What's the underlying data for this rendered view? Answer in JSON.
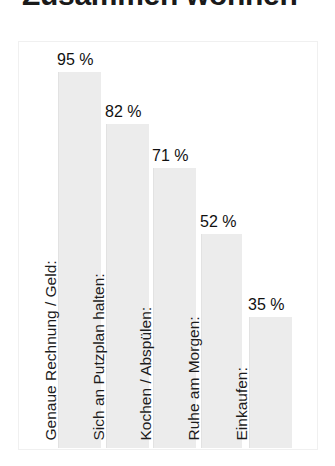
{
  "chart_data": {
    "type": "bar",
    "title": "Zusammen wohnen",
    "title_clipped": true,
    "xlabel": "",
    "ylabel": "",
    "ylim": [
      0,
      110
    ],
    "grid": false,
    "legend": "none",
    "value_suffix": "%",
    "categories": [
      "Genaue Rechnung / Geld:",
      "Sich an Putzplan halten:",
      "Kochen / Abspülen:",
      "Ruhe am Morgen:",
      "Einkaufen:"
    ],
    "values": [
      95,
      82,
      71,
      52,
      35
    ],
    "value_labels": [
      "95 %",
      "82 %",
      "71 %",
      "52 %",
      "35 %"
    ],
    "bar_color": "#ececec",
    "label_color": "#1c1c1c",
    "frame_color": "#f0f0f0",
    "background": "#ffffff"
  },
  "bars": [
    {
      "category": "Genaue Rechnung / Geld:",
      "value": 95,
      "value_label": "95 %",
      "left_px": 39,
      "width_px": 43,
      "height_px": 376,
      "label_bottom_px": 376
    },
    {
      "category": "Sich an Putzplan halten:",
      "value": 82,
      "value_label": "82 %",
      "left_px": 87,
      "width_px": 43,
      "height_px": 324,
      "label_bottom_px": 324
    },
    {
      "category": "Kochen / Abspülen:",
      "value": 71,
      "value_label": "71 %",
      "left_px": 134,
      "width_px": 43,
      "height_px": 280,
      "label_bottom_px": 280
    },
    {
      "category": "Ruhe am Morgen:",
      "value": 52,
      "value_label": "52 %",
      "left_px": 182,
      "width_px": 41,
      "height_px": 214,
      "label_bottom_px": 214
    },
    {
      "category": "Einkaufen:",
      "value": 35,
      "value_label": "35 %",
      "left_px": 230,
      "width_px": 43,
      "height_px": 131,
      "label_bottom_px": 131
    }
  ]
}
